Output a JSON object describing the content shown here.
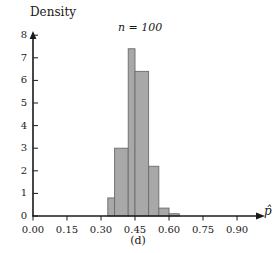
{
  "chart_data": {
    "type": "bar",
    "title": "",
    "annotation": "n = 100",
    "panel_caption": "(d)",
    "xlabel": "p̂",
    "ylabel": "Density",
    "xlim": [
      0.0,
      0.97
    ],
    "ylim": [
      0,
      8.4
    ],
    "xticks": [
      0.0,
      0.15,
      0.3,
      0.45,
      0.6,
      0.75,
      0.9
    ],
    "xtick_labels": [
      "0.00",
      "0.15",
      "0.30",
      "0.45",
      "0.60",
      "0.75",
      "0.90"
    ],
    "yticks": [
      0,
      1,
      2,
      3,
      4,
      5,
      6,
      7,
      8
    ],
    "ytick_labels": [
      "0",
      "1",
      "2",
      "3",
      "4",
      "5",
      "6",
      "7",
      "8"
    ],
    "grid": false,
    "legend": false,
    "bin_width": 0.03,
    "bin_edges": [
      0.3,
      0.33,
      0.36,
      0.39,
      0.42,
      0.45,
      0.48,
      0.51,
      0.54,
      0.57,
      0.6,
      0.63,
      0.66
    ],
    "categories": [
      "0.30-0.33",
      "0.33-0.36",
      "0.36-0.39",
      "0.39-0.42",
      "0.42-0.45",
      "0.45-0.48",
      "0.48-0.51",
      "0.51-0.54",
      "0.54-0.57",
      "0.57-0.60",
      "0.60-0.63",
      "0.63-0.66"
    ],
    "values": [
      0,
      0.8,
      3.0,
      3.0,
      7.4,
      6.4,
      6.4,
      2.2,
      2.2,
      0.35,
      0.35,
      0.1
    ],
    "bars": [
      {
        "x0": 0.33,
        "x1": 0.36,
        "height": 0.8
      },
      {
        "x0": 0.36,
        "x1": 0.42,
        "height": 3.0
      },
      {
        "x0": 0.42,
        "x1": 0.45,
        "height": 7.4
      },
      {
        "x0": 0.45,
        "x1": 0.51,
        "height": 6.4
      },
      {
        "x0": 0.51,
        "x1": 0.555,
        "height": 2.2
      },
      {
        "x0": 0.555,
        "x1": 0.6,
        "height": 0.35
      },
      {
        "x0": 0.6,
        "x1": 0.645,
        "height": 0.1
      }
    ],
    "colors": {
      "bar_fill": "#a8a8a8",
      "bar_stroke": "#6b6b6b",
      "axis": "#1a1a1a",
      "text": "#1a1a1a",
      "background": "#ffffff"
    }
  },
  "axes": {
    "y_axis_title": "Density",
    "x_axis_title": "p̂"
  },
  "notes": {
    "sample_size_text": "n = 100",
    "caption_text": "(d)"
  }
}
